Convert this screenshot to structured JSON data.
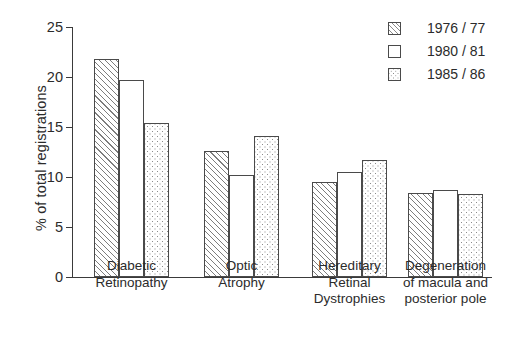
{
  "chart_data": {
    "type": "bar",
    "title": "",
    "xlabel": "",
    "ylabel": "% of total registrations",
    "ylim": [
      0,
      25
    ],
    "yticks": [
      0,
      5,
      10,
      15,
      20,
      25
    ],
    "ytick_labels": [
      "0",
      "5",
      "10",
      "15",
      "20",
      "25"
    ],
    "grid": false,
    "legend_position": "top-right",
    "categories": [
      "Diabetic Retinopathy",
      "Optic Atrophy",
      "Hereditary Retinal Dystrophies",
      "Degeneration of macula and posterior pole"
    ],
    "category_label_lines": [
      [
        "Diabetic",
        "Retinopathy"
      ],
      [
        "Optic",
        "Atrophy"
      ],
      [
        "Hereditary",
        "Retinal",
        "Dystrophies"
      ],
      [
        "Degeneration",
        "of macula and",
        "posterior pole"
      ]
    ],
    "series": [
      {
        "name": "1976 / 77",
        "pattern": "diagonal-hatch",
        "values": [
          21.8,
          12.6,
          9.5,
          8.4
        ]
      },
      {
        "name": "1980 / 81",
        "pattern": "empty",
        "values": [
          19.7,
          10.2,
          10.5,
          8.7
        ]
      },
      {
        "name": "1985 / 86",
        "pattern": "dotted",
        "values": [
          15.4,
          14.1,
          11.7,
          8.3
        ]
      }
    ]
  },
  "legend": {
    "items": [
      {
        "label": "1976 / 77",
        "pattern": "diagonal-hatch"
      },
      {
        "label": "1980 / 81",
        "pattern": "empty"
      },
      {
        "label": "1985 / 86",
        "pattern": "dotted"
      }
    ]
  },
  "colors": {
    "axis": "#3a3a3a",
    "bar_outline": "#4a4a4a",
    "pattern": "#8a8a8a",
    "background": "#ffffff",
    "text": "#2b2b2b"
  }
}
